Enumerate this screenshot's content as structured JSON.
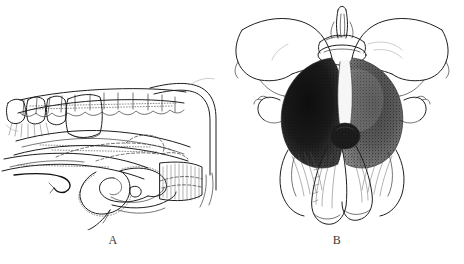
{
  "figure": {
    "kind": "anatomical-line-drawing",
    "panel_count": 2,
    "background_color": "#ffffff",
    "ink_color": "#1e1e1e",
    "shading_color": "#151515"
  },
  "panels": [
    {
      "id": "A",
      "label": "A",
      "caption": "",
      "view": "lateral sagittal dissection view",
      "features": [
        "vertebral column outline with segmented bodies",
        "dissected soft-tissue flap with dashed outline",
        "coiled tubular structure with stippled margin",
        "hatched fascial band",
        "curved retractor arms at right margin",
        "suture thread trailing below"
      ]
    },
    {
      "id": "B",
      "label": "B",
      "caption": "",
      "view": "anterior pelvic view",
      "features": [
        "paired winged iliac outlines",
        "central vertebral body and spinous process",
        "dark stippled mass occupying central basin",
        "paired descending tubular limbs",
        "lateral hooked processes",
        "fine fibre striations over lower body"
      ]
    }
  ],
  "labels": {
    "panel_a": "A",
    "panel_b": "B"
  }
}
